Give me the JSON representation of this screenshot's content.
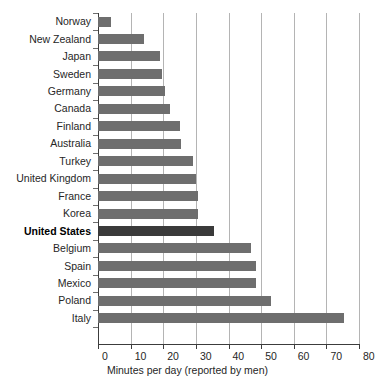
{
  "chart_data": {
    "type": "bar",
    "orientation": "horizontal",
    "title": "",
    "subtitle": "",
    "xlabel": "Minutes per day (reported by men)",
    "ylabel": "",
    "xlim": [
      0,
      80
    ],
    "xticks": [
      0,
      10,
      20,
      30,
      40,
      50,
      60,
      70,
      80
    ],
    "xtick_labels": [
      "0",
      "10",
      "20",
      "30",
      "40",
      "50",
      "60",
      "70",
      "80"
    ],
    "grid": "vertical",
    "legend": "none",
    "categories": [
      "Norway",
      "New Zealand",
      "Japan",
      "Sweden",
      "Germany",
      "Canada",
      "Finland",
      "Australia",
      "Turkey",
      "United Kingdom",
      "France",
      "Korea",
      "United States",
      "Belgium",
      "Spain",
      "Mexico",
      "Poland",
      "Italy"
    ],
    "values": [
      4,
      14,
      19,
      19.5,
      20.5,
      22,
      25,
      25.5,
      29,
      30,
      30.5,
      30.5,
      35.5,
      47,
      48.5,
      48.5,
      53,
      75.5
    ],
    "highlight_category": "United States",
    "colors": {
      "bar": "#6e6e6e",
      "bar_highlight": "#3a3a3a",
      "gridline": "#b4b4b4",
      "axis": "#3c3c3c",
      "text": "#262626",
      "background": "#ffffff"
    }
  }
}
